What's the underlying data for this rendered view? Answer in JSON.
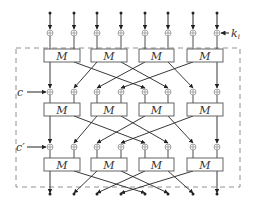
{
  "diagram": {
    "title": "",
    "columns_x": [
      50,
      74,
      97,
      121,
      145,
      168,
      193,
      217
    ],
    "box_label": "M",
    "rows": [
      {
        "xor_y": 33,
        "box_top": 49,
        "box_bottom": 62
      },
      {
        "xor_y": 92,
        "box_top": 103,
        "box_bottom": 116
      },
      {
        "xor_y": 147,
        "box_top": 158,
        "box_bottom": 171
      }
    ],
    "boxes_per_row": 4,
    "top_input_y": 13,
    "bottom_output_y": 194,
    "labels": {
      "key": "k",
      "key_sub": "i",
      "const1": "c",
      "const2": "c′"
    },
    "dashed_frame": {
      "x1": 16,
      "y1": 48,
      "x2": 240,
      "y2": 187
    },
    "permutation": [
      0,
      4,
      1,
      5,
      2,
      6,
      3,
      7
    ],
    "colors": {
      "line": "#222222",
      "xor": "#888888",
      "dash": "#777777",
      "box": "#555555"
    }
  }
}
